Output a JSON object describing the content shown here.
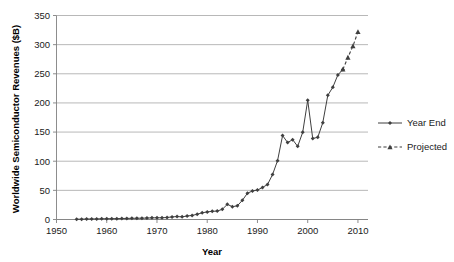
{
  "chart_data": {
    "type": "line",
    "title": "",
    "xlabel": "Year",
    "ylabel": "Worldwide Semiconductor Revenues ($B)",
    "xlim": [
      1950,
      2012
    ],
    "ylim": [
      0,
      350
    ],
    "xticks": [
      1950,
      1960,
      1970,
      1980,
      1990,
      2000,
      2010
    ],
    "yticks": [
      0,
      50,
      100,
      150,
      200,
      250,
      300,
      350
    ],
    "xtick_labels": [
      "1950",
      "1960",
      "1970",
      "1980",
      "1990",
      "2000",
      "2010"
    ],
    "ytick_labels": [
      "0",
      "50",
      "100",
      "150",
      "200",
      "250",
      "300",
      "350"
    ],
    "grid": "horizontal",
    "legend_position": "right",
    "series": [
      {
        "name": "Year End",
        "style": "solid",
        "marker": "diamond",
        "color": "#3f3f3f",
        "x": [
          1954,
          1955,
          1956,
          1957,
          1958,
          1959,
          1960,
          1961,
          1962,
          1963,
          1964,
          1965,
          1966,
          1967,
          1968,
          1969,
          1970,
          1971,
          1972,
          1973,
          1974,
          1975,
          1976,
          1977,
          1978,
          1979,
          1980,
          1981,
          1982,
          1983,
          1984,
          1985,
          1986,
          1987,
          1988,
          1989,
          1990,
          1991,
          1992,
          1993,
          1994,
          1995,
          1996,
          1997,
          1998,
          1999,
          2000,
          2001,
          2002,
          2003,
          2004,
          2005,
          2006,
          2007
        ],
        "values": [
          0.5,
          0.6,
          0.8,
          0.9,
          1.0,
          1.2,
          1.3,
          1.4,
          1.5,
          1.7,
          1.9,
          2.0,
          2.2,
          2.3,
          2.5,
          2.8,
          2.9,
          3.0,
          3.4,
          4.5,
          5.0,
          4.6,
          6.0,
          7.0,
          9.0,
          11.5,
          13.0,
          14.0,
          14.5,
          17.5,
          26.0,
          22.0,
          23.5,
          33.0,
          45.0,
          49.0,
          50.5,
          55.0,
          60.0,
          77.0,
          101.0,
          144.0,
          132.0,
          137.0,
          125.5,
          149.5,
          204.5,
          139.0,
          141.0,
          166.0,
          213.0,
          227.0,
          248.0,
          257.5
        ]
      },
      {
        "name": "Projected",
        "style": "dashed",
        "marker": "triangle",
        "color": "#3f3f3f",
        "x": [
          2007,
          2008,
          2009,
          2010
        ],
        "values": [
          257.5,
          278.0,
          297.5,
          322.0
        ]
      }
    ]
  },
  "legend": {
    "entries": [
      {
        "label": "Year End",
        "style": "solid",
        "marker": "diamond"
      },
      {
        "label": "Projected",
        "style": "dashed",
        "marker": "triangle"
      }
    ]
  }
}
